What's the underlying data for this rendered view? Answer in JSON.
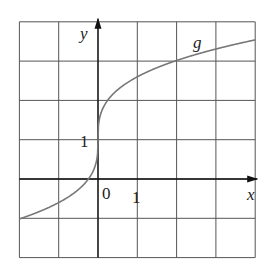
{
  "chart_data": {
    "type": "line",
    "title": "",
    "xlabel": "x",
    "ylabel": "y",
    "series": [
      {
        "name": "g",
        "x": [
          -2,
          -1.5,
          -1,
          -0.5,
          -0.25,
          -0.1,
          0,
          0.1,
          0.25,
          0.5,
          1,
          1.5,
          2,
          2.5,
          3,
          3.5,
          4
        ],
        "y": [
          -1.02,
          -0.83,
          -0.6,
          -0.27,
          -0.01,
          0.26,
          1.0,
          1.74,
          2.01,
          2.27,
          2.6,
          2.83,
          3.02,
          3.17,
          3.31,
          3.43,
          3.54
        ]
      }
    ],
    "xlim": [
      -2,
      4
    ],
    "ylim": [
      -2,
      4
    ],
    "xticks": [
      0,
      1
    ],
    "yticks": [
      1
    ],
    "grid": true,
    "curve_label": "g"
  },
  "labels": {
    "x_axis": "x",
    "y_axis": "y",
    "origin": "0",
    "x_tick_1": "1",
    "y_tick_1": "1",
    "curve": "g"
  }
}
